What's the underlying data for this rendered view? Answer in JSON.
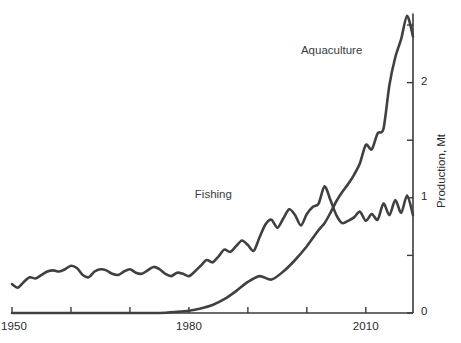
{
  "chart_data": {
    "type": "line",
    "title": "",
    "xlabel": "",
    "ylabel": "Production, Mt",
    "xlim": [
      1950,
      2018
    ],
    "ylim": [
      0,
      2.6
    ],
    "grid": false,
    "legend_position": "inline-annotations",
    "x_ticks": [
      1950,
      1960,
      1970,
      1980,
      1990,
      2000,
      2010
    ],
    "x_tick_labels": [
      "1950",
      "",
      "",
      "1980",
      "",
      "",
      "2010"
    ],
    "y_ticks": [
      0,
      0.5,
      1,
      1.5,
      2,
      2.5
    ],
    "y_tick_labels": [
      "0",
      "",
      "1",
      "",
      "2",
      ""
    ],
    "line_color": "#404040",
    "axis_color": "#3a3a3a",
    "series": [
      {
        "name": "Fishing",
        "label_x": 1981,
        "label_y": 1.02,
        "x": [
          1950,
          1951,
          1952,
          1953,
          1954,
          1955,
          1956,
          1957,
          1958,
          1959,
          1960,
          1961,
          1962,
          1963,
          1964,
          1965,
          1966,
          1967,
          1968,
          1969,
          1970,
          1971,
          1972,
          1973,
          1974,
          1975,
          1976,
          1977,
          1978,
          1979,
          1980,
          1981,
          1982,
          1983,
          1984,
          1985,
          1986,
          1987,
          1988,
          1989,
          1990,
          1991,
          1992,
          1993,
          1994,
          1995,
          1996,
          1997,
          1998,
          1999,
          2000,
          2001,
          2002,
          2003,
          2004,
          2005,
          2006,
          2007,
          2008,
          2009,
          2010,
          2011,
          2012,
          2013,
          2014,
          2015,
          2016,
          2017,
          2018
        ],
        "y": [
          0.25,
          0.22,
          0.27,
          0.31,
          0.3,
          0.33,
          0.36,
          0.37,
          0.36,
          0.38,
          0.41,
          0.39,
          0.33,
          0.31,
          0.36,
          0.38,
          0.37,
          0.34,
          0.33,
          0.36,
          0.38,
          0.35,
          0.34,
          0.37,
          0.4,
          0.38,
          0.34,
          0.32,
          0.35,
          0.34,
          0.32,
          0.36,
          0.41,
          0.46,
          0.44,
          0.49,
          0.55,
          0.53,
          0.58,
          0.63,
          0.59,
          0.54,
          0.66,
          0.77,
          0.81,
          0.74,
          0.82,
          0.9,
          0.85,
          0.76,
          0.86,
          0.92,
          0.95,
          1.1,
          0.98,
          0.85,
          0.78,
          0.8,
          0.83,
          0.88,
          0.8,
          0.86,
          0.81,
          0.95,
          0.85,
          0.98,
          0.87,
          1.02,
          0.85
        ]
      },
      {
        "name": "Aquaculture",
        "label_x": 1999,
        "label_y": 2.27,
        "x": [
          1950,
          1955,
          1960,
          1965,
          1970,
          1975,
          1978,
          1980,
          1982,
          1984,
          1986,
          1988,
          1990,
          1992,
          1994,
          1996,
          1998,
          2000,
          2002,
          2003,
          2004,
          2005,
          2006,
          2007,
          2008,
          2009,
          2010,
          2011,
          2012,
          2013,
          2014,
          2015,
          2016,
          2017,
          2018
        ],
        "y": [
          0.0,
          0.0,
          0.0,
          0.0,
          0.0,
          0.0,
          0.01,
          0.02,
          0.04,
          0.07,
          0.12,
          0.19,
          0.27,
          0.32,
          0.29,
          0.36,
          0.46,
          0.58,
          0.72,
          0.78,
          0.87,
          0.97,
          1.05,
          1.12,
          1.2,
          1.3,
          1.46,
          1.42,
          1.56,
          1.6,
          1.98,
          2.22,
          2.38,
          2.58,
          2.4
        ]
      }
    ]
  },
  "axes": {
    "x_tick_1950": "1950",
    "x_tick_1980": "1980",
    "x_tick_2010": "2010",
    "y_tick_0": "0",
    "y_tick_1": "1",
    "y_tick_2": "2",
    "y_axis_title": "Production, Mt"
  },
  "annotations": {
    "fishing": "Fishing",
    "aquaculture": "Aquaculture"
  }
}
